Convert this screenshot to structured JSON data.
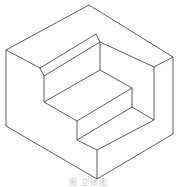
{
  "figure": {
    "type": "isometric-drawing",
    "stroke_color": "#333333",
    "background": "#ffffff"
  },
  "caption": "图 立体图"
}
